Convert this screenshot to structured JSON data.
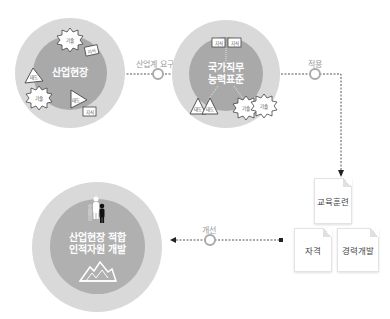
{
  "circles": {
    "industry": {
      "label": "산업현장"
    },
    "ncs": {
      "label_line1": "국가직무",
      "label_line2": "능력표준"
    },
    "result": {
      "label_line1": "산업현장 적합",
      "label_line2": "인적자원 개발"
    }
  },
  "icons": {
    "attitude": "태도",
    "skill": "기술",
    "knowledge": "지식"
  },
  "connectors": {
    "industry_demand": "산업계 요구",
    "apply": "적용",
    "improve": "개선"
  },
  "cards": {
    "training": "교육훈련",
    "qualification": "자격",
    "career": "경력개발"
  },
  "colors": {
    "outer_ring": "#d9d9d9",
    "inner_disc": "#a9a9a9",
    "connector": "#555555"
  }
}
